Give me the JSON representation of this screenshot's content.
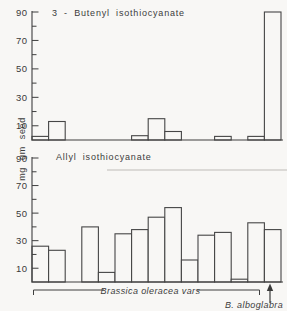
{
  "figure_title": "Isothiocyanate content of seed",
  "y_axis_label": "mg gm seed",
  "chart_data": [
    {
      "type": "bar",
      "title": "3 - Butenyl isothiocyanate",
      "ylabel": "mg gm seed",
      "ylim": [
        0,
        95
      ],
      "yticks": [
        10,
        30,
        50,
        70,
        90
      ],
      "minor_yticks": [
        20,
        40,
        60,
        80
      ],
      "grid": false,
      "n_slots": 15,
      "values": [
        2.5,
        13,
        0,
        0,
        0,
        0,
        3,
        15,
        6,
        0,
        0,
        2.5,
        0,
        2.5,
        90
      ]
    },
    {
      "type": "bar",
      "title": "Allyl isothiocyanate",
      "ylabel": "mg gm seed",
      "ylim": [
        0,
        95
      ],
      "yticks": [
        10,
        30,
        50,
        70,
        90
      ],
      "minor_yticks": [
        20,
        40,
        60,
        80
      ],
      "grid": false,
      "n_slots": 15,
      "values": [
        26,
        23,
        0,
        40,
        7,
        35,
        38,
        47,
        54,
        16,
        34,
        36,
        2,
        43,
        38
      ],
      "x_group_labels": [
        {
          "label": "Brassica oleracea vars",
          "slots": "1-14",
          "style": "bracket"
        },
        {
          "label": "B. alboglabra",
          "slots": "15",
          "style": "arrow"
        }
      ]
    }
  ]
}
